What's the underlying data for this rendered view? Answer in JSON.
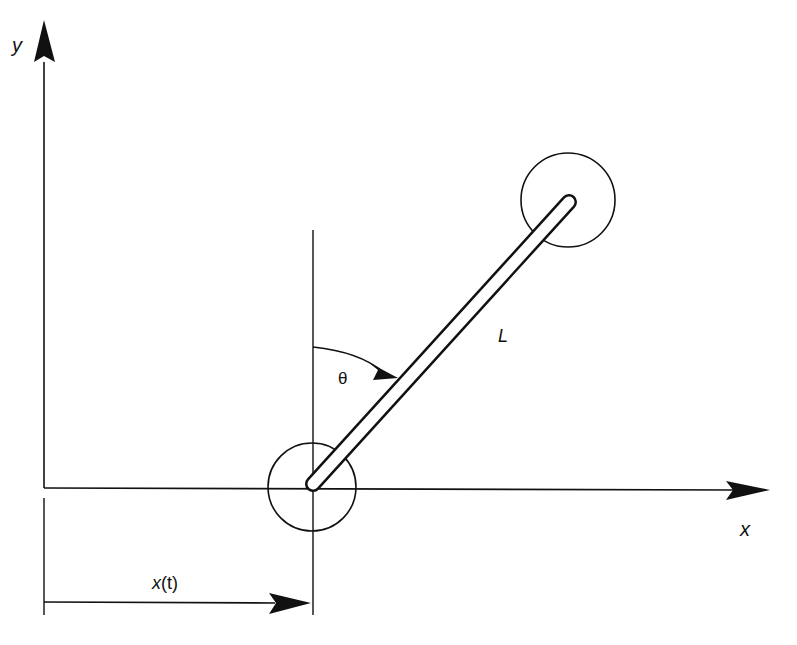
{
  "diagram": {
    "labels": {
      "y_axis": "y",
      "x_axis": "x",
      "angle": "θ",
      "length": "L",
      "displacement_var": "x",
      "displacement_arg": "(t)"
    },
    "colors": {
      "stroke": "#111111",
      "background": "#ffffff"
    }
  }
}
